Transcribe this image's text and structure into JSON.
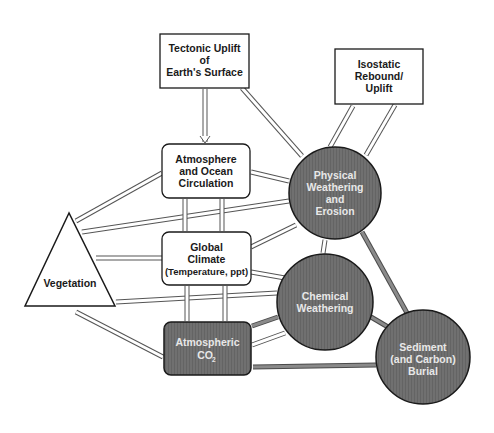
{
  "diagram": {
    "nodes": {
      "tectonic": {
        "lines": [
          "Tectonic Uplift",
          "of",
          "Earth's Surface"
        ],
        "shape": "rectangle"
      },
      "isostatic": {
        "lines": [
          "Isostatic",
          "Rebound/",
          "Uplift"
        ],
        "shape": "rectangle"
      },
      "atmosphere_ocean": {
        "lines": [
          "Atmosphere",
          "and Ocean",
          "Circulation"
        ],
        "shape": "rounded-rectangle"
      },
      "global_climate": {
        "lines": [
          "Global",
          "Climate",
          "(Temperature, ppt)"
        ],
        "shape": "rounded-rectangle"
      },
      "atmospheric_co2": {
        "lines": [
          "Atmospheric",
          "CO",
          "2"
        ],
        "shape": "rounded-rectangle-dark"
      },
      "physical_weathering": {
        "lines": [
          "Physical",
          "Weathering",
          "and",
          "Erosion"
        ],
        "shape": "circle-dark"
      },
      "chemical_weathering": {
        "lines": [
          "Chemical",
          "Weathering"
        ],
        "shape": "circle-dark"
      },
      "sediment_burial": {
        "lines": [
          "Sediment",
          "(and Carbon)",
          "Burial"
        ],
        "shape": "circle-dark"
      },
      "vegetation": {
        "lines": [
          "Vegetation"
        ],
        "shape": "triangle"
      }
    },
    "colors": {
      "dark_fill": "#6e6e6e",
      "outline": "#1a1a1a",
      "light_fill": "#ffffff",
      "thick_link": "#7a7a7a"
    }
  }
}
